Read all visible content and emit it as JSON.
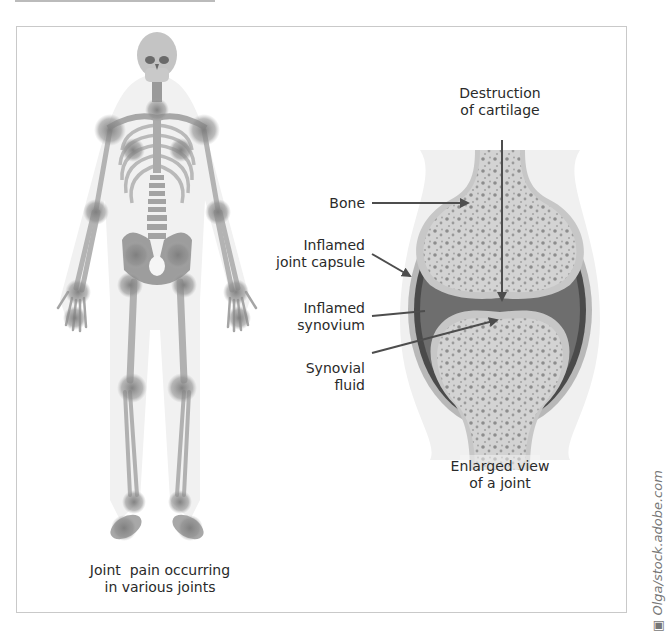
{
  "figure": {
    "left_panel": {
      "caption_line1": "Joint  pain occurring",
      "caption_line2": "in various joints",
      "inflamed_joint_sites": [
        "neck",
        "shoulders",
        "elbows",
        "wrists",
        "hands",
        "spine",
        "hips",
        "knees",
        "ankles",
        "feet"
      ]
    },
    "right_panel": {
      "top_label_line1": "Destruction",
      "top_label_line2": "of cartilage",
      "labels": {
        "bone": "Bone",
        "capsule_line1": "Inflamed",
        "capsule_line2": "joint capsule",
        "synovium_line1": "Inflamed",
        "synovium_line2": "synovium",
        "fluid_line1": "Synovial",
        "fluid_line2": "fluid"
      },
      "caption_line1": "Enlarged view",
      "caption_line2": "of a joint"
    },
    "credit": "Olga/stock.adobe.com",
    "credit_icon": "camera-icon",
    "colors": {
      "bone": "#cfcfcf",
      "bone_dots": "#8a8a8a",
      "synovium": "#6e6e6e",
      "capsule": "#4a4a4a",
      "halo": "#ececec",
      "inflamed": "#8c8c8c",
      "arrow": "#4d4d4d"
    }
  }
}
